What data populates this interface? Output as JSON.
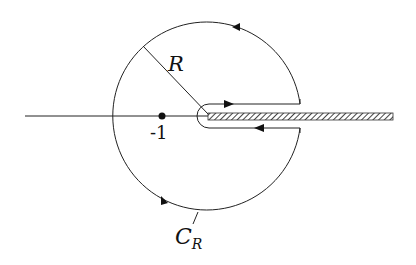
{
  "diagram": {
    "type": "keyhole contour",
    "labels": {
      "radius": "R",
      "point": "-1",
      "contour": "C",
      "contour_sub": "R"
    },
    "colors": {
      "stroke": "#222222",
      "background": "#ffffff",
      "hatch": "#555555"
    }
  }
}
